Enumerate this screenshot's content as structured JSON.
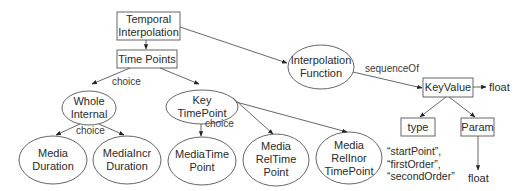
{
  "diagram": {
    "nodes": {
      "temporal_interpolation": {
        "line1": "Temporal",
        "line2": "Interpolation",
        "shape": "rect"
      },
      "time_points": {
        "label": "Time Points",
        "shape": "rect"
      },
      "whole_internal": {
        "line1": "Whole",
        "line2": "Internal",
        "shape": "ellipse"
      },
      "key_timepoint": {
        "line1": "Key",
        "line2": "TimePoint",
        "shape": "ellipse"
      },
      "interpolation_function": {
        "line1": "Interpolation",
        "line2": "Function",
        "shape": "ellipse"
      },
      "keyvalue": {
        "label": "KeyValue",
        "shape": "rect"
      },
      "type": {
        "label": "type",
        "shape": "rect"
      },
      "param": {
        "label": "Param",
        "shape": "rect"
      },
      "media_duration": {
        "line1": "Media",
        "line2": "Duration",
        "shape": "ellipse"
      },
      "mediaincr_duration": {
        "line1": "MediaIncr",
        "line2": "Duration",
        "shape": "ellipse"
      },
      "mediatime_point": {
        "line1": "MediaTime",
        "line2": "Point",
        "shape": "ellipse"
      },
      "media_reltime_point": {
        "line1": "Media",
        "line2": "RelTime",
        "line3": "Point",
        "shape": "ellipse"
      },
      "media_relinor_timepoint": {
        "line1": "Media",
        "line2": "RelInor",
        "line3": "TimePoint",
        "shape": "ellipse"
      }
    },
    "terminals": {
      "keyvalue_float": "float",
      "param_float": "float"
    },
    "edge_labels": {
      "timepoints_choice": "choice",
      "whole_internal_choice": "choice",
      "key_timepoint_choice": "choice",
      "sequence_of": "sequenceOf"
    },
    "type_values": {
      "line1": "“startPoint”,",
      "line2": "“firstOrder”,",
      "line3": "“secondOrder”"
    },
    "edges": [
      {
        "from": "Temporal Interpolation",
        "to": "Time Points"
      },
      {
        "from": "Temporal Interpolation",
        "to": "Interpolation Function"
      },
      {
        "from": "Time Points",
        "to": "Whole Internal",
        "label": "choice"
      },
      {
        "from": "Time Points",
        "to": "Key TimePoint"
      },
      {
        "from": "Whole Internal",
        "to": "Media Duration",
        "label": "choice"
      },
      {
        "from": "Whole Internal",
        "to": "MediaIncr Duration"
      },
      {
        "from": "Key TimePoint",
        "to": "MediaTime Point",
        "label": "choice"
      },
      {
        "from": "Key TimePoint",
        "to": "Media RelTime Point"
      },
      {
        "from": "Key TimePoint",
        "to": "Media RelInor TimePoint"
      },
      {
        "from": "Interpolation Function",
        "to": "KeyValue",
        "label": "sequenceOf"
      },
      {
        "from": "KeyValue",
        "to": "float"
      },
      {
        "from": "KeyValue",
        "to": "type"
      },
      {
        "from": "KeyValue",
        "to": "Param"
      },
      {
        "from": "Param",
        "to": "float"
      }
    ]
  }
}
